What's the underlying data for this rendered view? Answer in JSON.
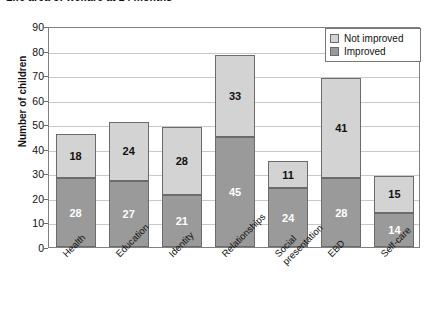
{
  "chart_data": {
    "type": "bar",
    "subtype": "stacked-vertical",
    "title": "Life area of welfare at 24 months",
    "xlabel": "",
    "ylabel": "Number of children",
    "ylim": [
      0,
      90
    ],
    "ytick_step": 10,
    "yticks": [
      0,
      10,
      20,
      30,
      40,
      50,
      60,
      70,
      80,
      90
    ],
    "grid": "horizontal",
    "legend_position": "top-right",
    "categories": [
      "Health",
      "Education",
      "Identity",
      "Relationships",
      "Social presentation",
      "EBD",
      "Self-care"
    ],
    "category_lines": [
      [
        "Health"
      ],
      [
        "Education"
      ],
      [
        "Identity"
      ],
      [
        "Relationships"
      ],
      [
        "Social",
        "presentation"
      ],
      [
        "EBD"
      ],
      [
        "Self-care"
      ]
    ],
    "series": [
      {
        "name": "Improved",
        "color": "#9a9a9a",
        "label_color": "#ffffff",
        "values": [
          28,
          27,
          21,
          45,
          24,
          28,
          14
        ]
      },
      {
        "name": "Not improved",
        "color": "#d3d3d3",
        "label_color": "#111111",
        "values": [
          18,
          24,
          28,
          33,
          11,
          41,
          15
        ]
      }
    ],
    "totals": [
      46,
      51,
      49,
      78,
      35,
      69,
      29
    ]
  },
  "legend": {
    "items": [
      {
        "label": "Not improved",
        "color": "#d3d3d3"
      },
      {
        "label": "Improved",
        "color": "#9a9a9a"
      }
    ]
  },
  "colors": {
    "not_improved": "#d3d3d3",
    "improved": "#9a9a9a",
    "axis": "#808080",
    "gridline": "#c8c8c8",
    "text": "#111111",
    "background": "#ffffff"
  }
}
